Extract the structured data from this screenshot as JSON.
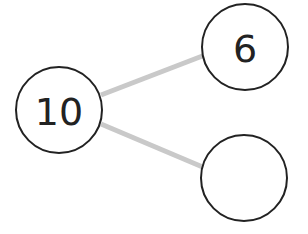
{
  "diagram": {
    "type": "number-bond",
    "edge_color": "#c9c9c9",
    "node_stroke_color": "#222222",
    "nodes": [
      {
        "id": "whole",
        "label": "10",
        "cx": 59,
        "cy": 110,
        "r": 43
      },
      {
        "id": "part-top",
        "label": "6",
        "cx": 245,
        "cy": 47,
        "r": 43
      },
      {
        "id": "part-bottom",
        "label": "",
        "cx": 244,
        "cy": 178,
        "r": 43
      }
    ],
    "edges": [
      {
        "from": "whole",
        "to": "part-top",
        "x1": 101,
        "y1": 95,
        "x2": 205,
        "y2": 55
      },
      {
        "from": "whole",
        "to": "part-bottom",
        "x1": 101,
        "y1": 124,
        "x2": 205,
        "y2": 168
      }
    ]
  }
}
